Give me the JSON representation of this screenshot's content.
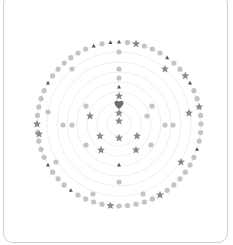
{
  "board": {
    "center": [
      119,
      124
    ],
    "rings": [
      12,
      22,
      32,
      42,
      52,
      62,
      72,
      82
    ],
    "ring_color": "#f0f0f0",
    "piece_color_dot": "#c4c4c4",
    "piece_color_star": "#8a8a8a",
    "piece_color_triangle": "#555555",
    "piece_color_heart": "#6e6e6e",
    "outer_ring": {
      "radius": 82,
      "count": 60,
      "stars_at": [
        2,
        9,
        13,
        25,
        31,
        45
      ],
      "triangles_at": [
        0,
        6,
        10,
        18,
        36,
        40,
        50,
        57,
        59
      ]
    },
    "pieces": [
      {
        "type": "dot",
        "x": 119,
        "y": 52
      },
      {
        "type": "dot",
        "x": 119,
        "y": 69
      },
      {
        "type": "dot",
        "x": 119,
        "y": 78
      },
      {
        "type": "triangle",
        "x": 119,
        "y": 87
      },
      {
        "type": "star",
        "x": 119,
        "y": 96
      },
      {
        "type": "heart",
        "x": 119,
        "y": 104
      },
      {
        "type": "star",
        "x": 119,
        "y": 113
      },
      {
        "type": "star",
        "x": 119,
        "y": 121
      },
      {
        "type": "star",
        "x": 119,
        "y": 138
      },
      {
        "type": "triangle",
        "x": 119,
        "y": 165
      },
      {
        "type": "dot",
        "x": 119,
        "y": 182
      },
      {
        "type": "star",
        "x": 90,
        "y": 116
      },
      {
        "type": "star",
        "x": 100,
        "y": 136
      },
      {
        "type": "star",
        "x": 137,
        "y": 136
      },
      {
        "type": "star",
        "x": 101,
        "y": 150
      },
      {
        "type": "star",
        "x": 136,
        "y": 150
      },
      {
        "type": "dot",
        "x": 86,
        "y": 106
      },
      {
        "type": "dot",
        "x": 152,
        "y": 106
      },
      {
        "type": "dot",
        "x": 147,
        "y": 116
      },
      {
        "type": "dot",
        "x": 63,
        "y": 125
      },
      {
        "type": "dot",
        "x": 72,
        "y": 125
      },
      {
        "type": "dot",
        "x": 165,
        "y": 125
      },
      {
        "type": "dot",
        "x": 173,
        "y": 125
      },
      {
        "type": "dot",
        "x": 86,
        "y": 145
      },
      {
        "type": "dot",
        "x": 151,
        "y": 145
      },
      {
        "type": "dot",
        "x": 72,
        "y": 69
      },
      {
        "type": "dot",
        "x": 48,
        "y": 112
      },
      {
        "type": "dot",
        "x": 56,
        "y": 162
      },
      {
        "type": "dot",
        "x": 93,
        "y": 194
      },
      {
        "type": "dot",
        "x": 143,
        "y": 194
      },
      {
        "type": "star",
        "x": 165,
        "y": 69
      },
      {
        "type": "star",
        "x": 189,
        "y": 113
      },
      {
        "type": "star",
        "x": 39,
        "y": 134
      },
      {
        "type": "star",
        "x": 181,
        "y": 162
      }
    ]
  }
}
